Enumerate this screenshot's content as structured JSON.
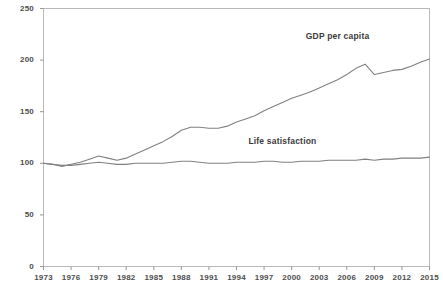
{
  "chart_data": {
    "type": "line",
    "title": "",
    "subtitle": "",
    "xlabel": "",
    "ylabel": "",
    "xlim": [
      1973,
      2015
    ],
    "ylim": [
      0,
      250
    ],
    "yticks": [
      0,
      50,
      100,
      150,
      200,
      250
    ],
    "xticks": [
      1973,
      1976,
      1979,
      1982,
      1985,
      1988,
      1991,
      1994,
      1997,
      2000,
      2003,
      2006,
      2009,
      2012,
      2015
    ],
    "grid": false,
    "legend_position": "inline-annotations",
    "x": [
      1973,
      1974,
      1975,
      1976,
      1977,
      1978,
      1979,
      1980,
      1981,
      1982,
      1983,
      1984,
      1985,
      1986,
      1987,
      1988,
      1989,
      1990,
      1991,
      1992,
      1993,
      1994,
      1995,
      1996,
      1997,
      1998,
      1999,
      2000,
      2001,
      2002,
      2003,
      2004,
      2005,
      2006,
      2007,
      2008,
      2009,
      2010,
      2011,
      2012,
      2013,
      2014,
      2015
    ],
    "series": [
      {
        "name": "GDP per capita",
        "color": "#808080",
        "annotation": "GDP per capita",
        "values": [
          100,
          99,
          97,
          99,
          101,
          104,
          107,
          105,
          103,
          105,
          109,
          113,
          117,
          121,
          126,
          132,
          135,
          135,
          134,
          134,
          136,
          140,
          143,
          146,
          151,
          155,
          159,
          163,
          166,
          169,
          173,
          177,
          181,
          186,
          192,
          196,
          186,
          188,
          190,
          191,
          194,
          198,
          201
        ]
      },
      {
        "name": "Life satisfaction",
        "color": "#808080",
        "annotation": "Life satisfaction",
        "values": [
          100,
          99,
          98,
          98,
          99,
          100,
          101,
          100,
          99,
          99,
          100,
          100,
          100,
          100,
          101,
          102,
          102,
          101,
          100,
          100,
          100,
          101,
          101,
          101,
          102,
          102,
          101,
          101,
          102,
          102,
          102,
          103,
          103,
          103,
          103,
          104,
          103,
          104,
          104,
          105,
          105,
          105,
          106
        ]
      }
    ],
    "annotations": [
      {
        "text": "GDP per capita",
        "x": 2005,
        "y": 222
      },
      {
        "text": "Life satisfaction",
        "x": 1999,
        "y": 121
      }
    ]
  }
}
